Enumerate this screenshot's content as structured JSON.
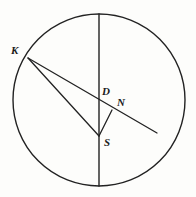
{
  "figure": {
    "canvas": {
      "width": 196,
      "height": 197
    },
    "background_color": "#fdfdfb",
    "stroke_color": "#222222",
    "label_color": "#1a1a1a"
  },
  "chart_data": {
    "type": "diagram",
    "shapes": {
      "circle": {
        "cx": 99,
        "cy": 100,
        "r": 86,
        "stroke": "#222222",
        "fill": "none",
        "stroke_width": 1.4
      },
      "vertical_diameter": {
        "x1": 99,
        "y1": 14,
        "x2": 99,
        "y2": 186,
        "stroke": "#222222",
        "stroke_width": 1.4
      },
      "ray_K_through_D_N": {
        "x1": 28,
        "y1": 58,
        "x2": 157,
        "y2": 133,
        "stroke": "#222222",
        "stroke_width": 1.3
      },
      "segment_K_S": {
        "x1": 28,
        "y1": 58,
        "x2": 99,
        "y2": 136,
        "stroke": "#222222",
        "stroke_width": 1.3
      },
      "segment_S_N": {
        "x1": 99,
        "y1": 136,
        "x2": 112,
        "y2": 110,
        "stroke": "#222222",
        "stroke_width": 1.3
      }
    },
    "points": [
      {
        "id": "K",
        "label": "K",
        "x": 28,
        "y": 58,
        "label_x": 11,
        "label_y": 45,
        "on": "circle"
      },
      {
        "id": "D",
        "label": "D",
        "x": 99,
        "y": 98,
        "label_x": 102,
        "label_y": 86,
        "on": "vertical-diameter"
      },
      {
        "id": "N",
        "label": "N",
        "x": 112,
        "y": 110,
        "label_x": 117,
        "label_y": 97,
        "on": "ray"
      },
      {
        "id": "S",
        "label": "S",
        "x": 99,
        "y": 136,
        "label_x": 104,
        "label_y": 137,
        "on": "vertical-diameter"
      }
    ],
    "labels": [
      "K",
      "D",
      "N",
      "S"
    ]
  }
}
